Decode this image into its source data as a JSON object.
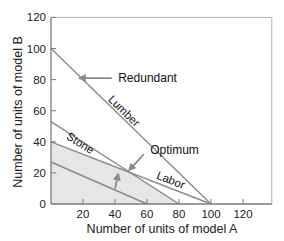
{
  "chart_data": {
    "type": "line",
    "title": "",
    "xlabel": "Number of units of model A",
    "ylabel": "Number of units of model B",
    "xlim": [
      0,
      138
    ],
    "ylim": [
      0,
      120
    ],
    "xticks": [
      20,
      40,
      60,
      80,
      100,
      120
    ],
    "yticks": [
      0,
      20,
      40,
      60,
      80,
      100,
      120
    ],
    "grid": false,
    "series": [
      {
        "name": "Lumber",
        "x": [
          0,
          100
        ],
        "y": [
          100,
          0
        ],
        "label_pos": [
          44,
          58
        ]
      },
      {
        "name": "Stone",
        "x": [
          0,
          80
        ],
        "y": [
          53,
          0
        ],
        "label_pos": [
          17,
          37
        ]
      },
      {
        "name": "Labor",
        "x": [
          0,
          100
        ],
        "y": [
          40,
          0
        ],
        "label_pos": [
          74,
          13
        ]
      },
      {
        "name": "iso-profit",
        "x": [
          0,
          60
        ],
        "y": [
          27,
          0
        ]
      }
    ],
    "feasible_region": {
      "polygon": [
        [
          0,
          0
        ],
        [
          0,
          40
        ],
        [
          48,
          21
        ],
        [
          80,
          0
        ]
      ],
      "fill": "#e6e6e6"
    },
    "annotations": [
      {
        "text": "Redundant",
        "text_pos": [
          42,
          81
        ],
        "arrow_from": [
          38,
          81
        ],
        "arrow_to": [
          18,
          81
        ]
      },
      {
        "text": "Optimum",
        "text_pos": [
          62,
          35
        ],
        "arrow_from": [
          58,
          32
        ],
        "arrow_to": [
          49,
          22
        ]
      },
      {
        "text": "",
        "arrow_from": [
          40,
          10
        ],
        "arrow_to": [
          42,
          19
        ]
      }
    ],
    "colors": {
      "line": "#8a8a8a",
      "axis": "#7a7a7a",
      "region": "#e6e6e6",
      "text": "#1a1a1a"
    }
  }
}
